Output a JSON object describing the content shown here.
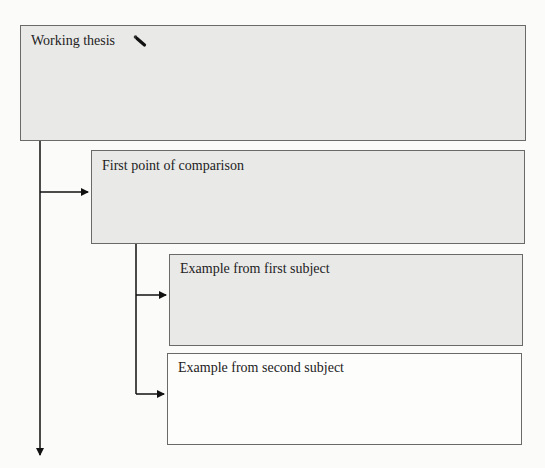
{
  "diagram": {
    "boxes": [
      {
        "id": "thesis",
        "label": "Working thesis",
        "shaded": true,
        "has_icon": "pencil-icon"
      },
      {
        "id": "point",
        "label": "First point of comparison",
        "shaded": true
      },
      {
        "id": "example1",
        "label": "Example from first subject",
        "shaded": true
      },
      {
        "id": "example2",
        "label": "Example from second subject",
        "shaded": false
      }
    ],
    "connectors": [
      {
        "from": "thesis",
        "to": "point",
        "type": "arrow"
      },
      {
        "from": "point",
        "to": "example1",
        "type": "arrow"
      },
      {
        "from": "point",
        "to": "example2",
        "type": "arrow"
      },
      {
        "from": "thesis",
        "to": "continuation",
        "type": "arrow-down"
      }
    ]
  },
  "colors": {
    "shaded_fill": "#e9e9e8",
    "border": "#6a6a6a",
    "line": "#111111",
    "background": "#fbfbfa"
  }
}
